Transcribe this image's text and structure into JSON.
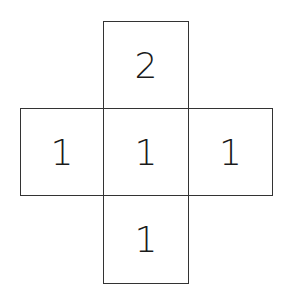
{
  "diagram": {
    "type": "cube-net",
    "cells": [
      {
        "position": "top",
        "value": "2"
      },
      {
        "position": "middle-left",
        "value": "1"
      },
      {
        "position": "center",
        "value": "1"
      },
      {
        "position": "middle-right",
        "value": "1"
      },
      {
        "position": "bottom",
        "value": "1"
      }
    ]
  }
}
